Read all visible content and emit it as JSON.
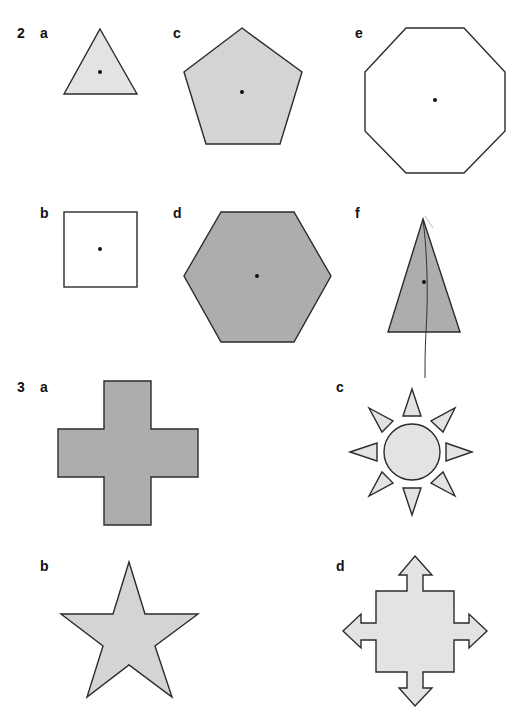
{
  "exercises": [
    {
      "number": "2",
      "number_pos": [
        17,
        26
      ]
    },
    {
      "number": "3",
      "number_pos": [
        17,
        380
      ]
    }
  ],
  "labels": [
    {
      "id": "2a",
      "text": "a",
      "pos": [
        40,
        26
      ]
    },
    {
      "id": "2b",
      "text": "b",
      "pos": [
        40,
        206
      ]
    },
    {
      "id": "2c",
      "text": "c",
      "pos": [
        173,
        26
      ]
    },
    {
      "id": "2d",
      "text": "d",
      "pos": [
        173,
        206
      ]
    },
    {
      "id": "2e",
      "text": "e",
      "pos": [
        355,
        26
      ]
    },
    {
      "id": "2f",
      "text": "f",
      "pos": [
        355,
        206
      ]
    },
    {
      "id": "3a",
      "text": "a",
      "pos": [
        40,
        380
      ]
    },
    {
      "id": "3b",
      "text": "b",
      "pos": [
        40,
        559
      ]
    },
    {
      "id": "3c",
      "text": "c",
      "pos": [
        336,
        380
      ]
    },
    {
      "id": "3d",
      "text": "d",
      "pos": [
        336,
        559
      ]
    }
  ],
  "colors": {
    "light_fill": "#e3e3e3",
    "mid_fill": "#d4d4d4",
    "dark_fill": "#adadad",
    "white_fill": "#ffffff",
    "stroke": "#2b2b2b"
  },
  "shapes": [
    {
      "id": "2a",
      "name": "equilateral-triangle",
      "fill": "light",
      "center_dot": [
        100,
        72
      ]
    },
    {
      "id": "2b",
      "name": "square",
      "fill": "white",
      "center_dot": [
        100,
        249
      ]
    },
    {
      "id": "2c",
      "name": "regular-pentagon",
      "fill": "mid",
      "center_dot": [
        242,
        92
      ]
    },
    {
      "id": "2d",
      "name": "regular-hexagon",
      "fill": "dark",
      "center_dot": [
        257,
        276
      ]
    },
    {
      "id": "2e",
      "name": "regular-octagon",
      "fill": "white",
      "center_dot": [
        435,
        100
      ]
    },
    {
      "id": "2f",
      "name": "isosceles-triangle",
      "fill": "dark",
      "center_dot": [
        424,
        282
      ]
    },
    {
      "id": "3a",
      "name": "cross",
      "fill": "dark"
    },
    {
      "id": "3b",
      "name": "five-point-star",
      "fill": "mid"
    },
    {
      "id": "3c",
      "name": "sun",
      "fill": "light"
    },
    {
      "id": "3d",
      "name": "four-arrow-square",
      "fill": "light"
    }
  ]
}
